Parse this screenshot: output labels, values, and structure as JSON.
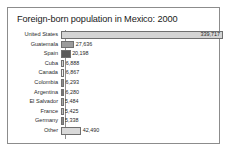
{
  "figure": {
    "title": "Foreign-born population in Mexico: 2000",
    "border_color": "#8c8c8c",
    "background": "#ffffff"
  },
  "chart_data": {
    "type": "bar",
    "orientation": "horizontal",
    "title": "Foreign-born population in Mexico: 2000",
    "xlabel": "",
    "ylabel": "",
    "grid": false,
    "legend": "none",
    "xlim": [
      0,
      339717
    ],
    "categories": [
      "United States",
      "Guatemala",
      "Spain",
      "Cuba",
      "Canada",
      "Colombia",
      "Argentina",
      "El Salvador",
      "France",
      "Germany",
      "Other"
    ],
    "values": [
      339717,
      27636,
      20198,
      6888,
      6867,
      6293,
      6280,
      5484,
      5425,
      5338,
      42490
    ],
    "value_labels": [
      "339,717",
      "27,636",
      "20,198",
      "6,888",
      "6,867",
      "6,293",
      "6,280",
      "5,484",
      "5,425",
      "5,338",
      "42,490"
    ],
    "bar_colors": [
      "#d4d4d4",
      "#9b9b9b",
      "#5a5a5a",
      "#cfcfcf",
      "#efefef",
      "#8f8f8f",
      "#777777",
      "#a8a8a8",
      "#bdbdbd",
      "#8a8a8a",
      "#d9d9d9"
    ],
    "bar_outline": "#6f6f6f",
    "label_inside_bar": [
      true,
      false,
      false,
      false,
      false,
      false,
      false,
      false,
      false,
      false,
      false
    ]
  }
}
